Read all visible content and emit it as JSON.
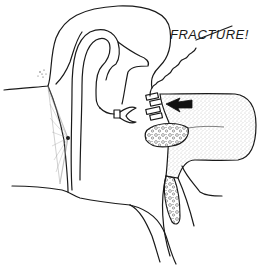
{
  "diagram": {
    "type": "anatomical-illustration",
    "annotation": {
      "text": "FRACTURE!",
      "x": 172,
      "y": 36
    },
    "arrow": {
      "direction": "left",
      "x": 168,
      "y": 104
    },
    "colors": {
      "ink": "#1a1a1a",
      "stipple": "#9a9a9a",
      "background": "#ffffff"
    }
  }
}
